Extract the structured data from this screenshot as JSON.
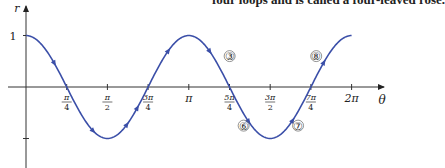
{
  "caption_fragment": "four loops and is called a four-leaved rose.",
  "chart_data": {
    "type": "line",
    "title": "",
    "function": "r = cos 2θ",
    "xlabel": "θ",
    "ylabel": "r",
    "xlim": [
      0,
      6.5
    ],
    "ylim": [
      -1.5,
      1.1
    ],
    "grid": false,
    "x_ticks": [
      {
        "value": 0.7854,
        "label_num": "π",
        "label_den": "4"
      },
      {
        "value": 1.5708,
        "label_num": "π",
        "label_den": "2"
      },
      {
        "value": 2.3562,
        "label_num": "3π",
        "label_den": "4"
      },
      {
        "value": 3.1416,
        "label": "π"
      },
      {
        "value": 3.927,
        "label_num": "5π",
        "label_den": "4"
      },
      {
        "value": 4.7124,
        "label_num": "3π",
        "label_den": "2"
      },
      {
        "value": 5.4978,
        "label_num": "7π",
        "label_den": "4"
      },
      {
        "value": 6.2832,
        "label": "2π"
      }
    ],
    "y_ticks": [
      {
        "value": 1,
        "label": "1"
      },
      {
        "value": -1,
        "label": ""
      }
    ],
    "series": [
      {
        "name": "cos 2θ",
        "color": "#3b4fa8",
        "x": [
          0,
          0.3927,
          0.7854,
          1.1781,
          1.5708,
          1.9635,
          2.3562,
          2.7489,
          3.1416,
          3.5343,
          3.927,
          4.3197,
          4.7124,
          5.1051,
          5.4978,
          5.8905,
          6.2832
        ],
        "y": [
          1,
          0.707,
          0,
          -0.707,
          -1,
          -0.707,
          0,
          0.707,
          1,
          0.707,
          0,
          -0.707,
          -1,
          -0.707,
          0,
          0.707,
          1
        ]
      }
    ],
    "annotations": [
      {
        "text": "③",
        "theta": 3.93,
        "r": 0.6
      },
      {
        "text": "⑥",
        "theta": 4.2,
        "r": -0.75
      },
      {
        "text": "⑦",
        "theta": 5.25,
        "r": -0.75
      },
      {
        "text": "⑧",
        "theta": 5.6,
        "r": 0.6
      }
    ]
  }
}
